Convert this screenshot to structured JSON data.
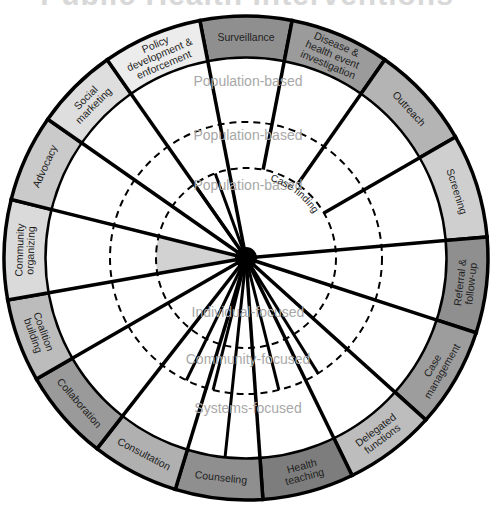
{
  "title": "Public Health Interventions",
  "center": {
    "x": 246,
    "y": 258
  },
  "radii": {
    "outer": 242,
    "band_inner": 200,
    "dashed_outer": 136,
    "dashed_inner": 90,
    "hub": 11
  },
  "colors": {
    "outline": "#000000",
    "level_text": "#a8a8a8",
    "wedge_shade": "#d2d2d2",
    "light": "#e9e9e9",
    "mid_light": "#cdcdcd",
    "mid": "#a9a9a9",
    "dark": "#8c8c8c"
  },
  "segments": [
    {
      "id": "surveillance",
      "lines": [
        "Surveillance"
      ],
      "start": -101,
      "end": -79,
      "fill": "#8f8f8f"
    },
    {
      "id": "disease-health-event-investigation",
      "lines": [
        "Disease &",
        "health event",
        "investigation"
      ],
      "start": -79,
      "end": -55,
      "fill": "#9b9b9b"
    },
    {
      "id": "outreach",
      "lines": [
        "Outreach"
      ],
      "start": -55,
      "end": -30,
      "fill": "#b4b4b4"
    },
    {
      "id": "screening",
      "lines": [
        "Screening"
      ],
      "start": -30,
      "end": -5,
      "fill": "#cfcfcf"
    },
    {
      "id": "referral-follow-up",
      "lines": [
        "Referral &",
        "follow-up"
      ],
      "start": -5,
      "end": 18,
      "fill": "#8f8f8f"
    },
    {
      "id": "case-management",
      "lines": [
        "Case",
        "management"
      ],
      "start": 18,
      "end": 42,
      "fill": "#9d9d9d"
    },
    {
      "id": "delegated-functions",
      "lines": [
        "Delegated",
        "functions"
      ],
      "start": 42,
      "end": 64,
      "fill": "#bdbdbd"
    },
    {
      "id": "health-teaching",
      "lines": [
        "Health",
        "teaching"
      ],
      "start": 64,
      "end": 86,
      "fill": "#7d7d7d"
    },
    {
      "id": "counseling",
      "lines": [
        "Counseling"
      ],
      "start": 86,
      "end": 107,
      "fill": "#8f8f8f"
    },
    {
      "id": "consultation",
      "lines": [
        "Consultation"
      ],
      "start": 107,
      "end": 128,
      "fill": "#b0b0b0"
    },
    {
      "id": "collaboration",
      "lines": [
        "Collaboration"
      ],
      "start": 128,
      "end": 150,
      "fill": "#9a9a9a"
    },
    {
      "id": "coalition-building",
      "lines": [
        "Coalition",
        "building"
      ],
      "start": 150,
      "end": 170,
      "fill": "#bcbcbc"
    },
    {
      "id": "community-organizing",
      "lines": [
        "Community",
        "organizing"
      ],
      "start": 170,
      "end": 194,
      "fill": "#dadada"
    },
    {
      "id": "advocacy",
      "lines": [
        "Advocacy"
      ],
      "start": 194,
      "end": 215,
      "fill": "#cacaca"
    },
    {
      "id": "social-marketing",
      "lines": [
        "Social",
        "marketing"
      ],
      "start": 215,
      "end": 235,
      "fill": "#dedede"
    },
    {
      "id": "policy-development-enforcement",
      "lines": [
        "Policy",
        "development &",
        "enforcement"
      ],
      "start": 235,
      "end": 259,
      "fill": "#ececec"
    }
  ],
  "spokes": [
    {
      "angle": -101,
      "to": "band_inner"
    },
    {
      "angle": -79,
      "to": "dashed_inner"
    },
    {
      "angle": -55,
      "to": "dashed_inner"
    },
    {
      "angle": -30,
      "to": "dashed_inner"
    },
    {
      "angle": -5,
      "to": "band_inner"
    },
    {
      "angle": 18,
      "to": "band_inner"
    },
    {
      "angle": 42,
      "to": "band_inner"
    },
    {
      "angle": 64,
      "to": "band_inner"
    },
    {
      "angle": 86,
      "to": "band_inner"
    },
    {
      "angle": 107,
      "to": "band_inner"
    },
    {
      "angle": 128,
      "to": "band_inner"
    },
    {
      "angle": 150,
      "to": "band_inner"
    },
    {
      "angle": 170,
      "to": "band_inner"
    },
    {
      "angle": 194,
      "to": "band_inner"
    },
    {
      "angle": 215,
      "to": "band_inner"
    },
    {
      "angle": 235,
      "to": "band_inner"
    }
  ],
  "shaded_wedge": {
    "start": 170,
    "end": 194,
    "radius": 90
  },
  "levels": {
    "top": [
      "Population-based",
      "Population-based",
      "Population-based"
    ],
    "bottom": [
      "Individual-focused",
      "Community-focused",
      "Systems-focused"
    ]
  },
  "case_finding": "Case finding"
}
